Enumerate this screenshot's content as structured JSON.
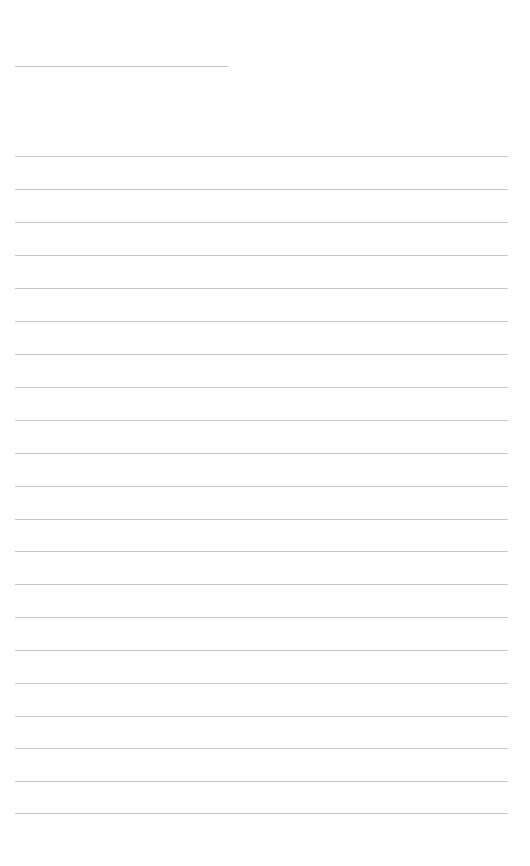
{
  "page": {
    "type": "lined-sheet",
    "title_line": {
      "x": 15,
      "y": 66,
      "width": 213,
      "text": ""
    },
    "rules": {
      "count": 21,
      "x": 15,
      "width": 493,
      "y_positions": [
        156,
        189,
        222,
        255,
        288,
        321,
        354,
        387,
        420,
        453,
        486,
        519,
        551,
        584,
        617,
        650,
        683,
        716,
        748,
        781,
        813
      ]
    },
    "colors": {
      "background": "#ffffff",
      "rule": "#c8c8c8"
    }
  }
}
